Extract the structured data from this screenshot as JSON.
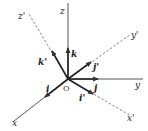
{
  "diagram": {
    "type": "rotated-coordinate-axes",
    "origin_label": "O",
    "axes": {
      "original": [
        {
          "name": "x",
          "label": "x",
          "style": "solid"
        },
        {
          "name": "y",
          "label": "y",
          "style": "solid"
        },
        {
          "name": "z",
          "label": "z",
          "style": "solid"
        }
      ],
      "rotated": [
        {
          "name": "x_prime",
          "label": "x'",
          "style": "dashed"
        },
        {
          "name": "y_prime",
          "label": "y'",
          "style": "dashed"
        },
        {
          "name": "z_prime",
          "label": "z'",
          "style": "dashed"
        }
      ]
    },
    "unit_vectors": {
      "original": [
        {
          "name": "i",
          "label": "i"
        },
        {
          "name": "j",
          "label": "j"
        },
        {
          "name": "k",
          "label": "k"
        }
      ],
      "rotated": [
        {
          "name": "i_prime",
          "label": "i'"
        },
        {
          "name": "j_prime",
          "label": "j'"
        },
        {
          "name": "k_prime",
          "label": "k'"
        }
      ]
    },
    "colors": {
      "line": "#333333",
      "background": "#ffffff"
    }
  }
}
